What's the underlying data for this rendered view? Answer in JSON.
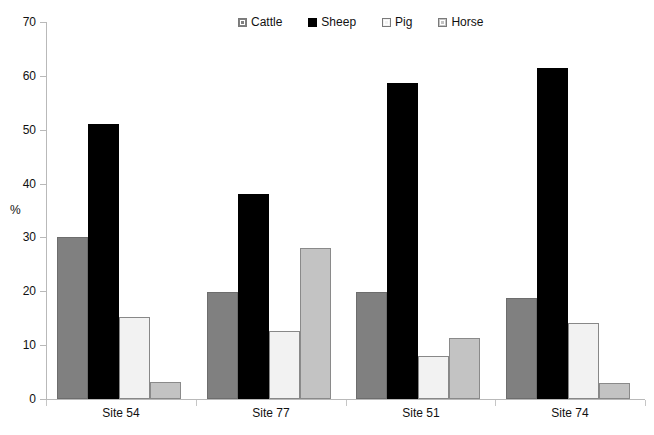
{
  "chart_data": {
    "type": "bar",
    "title": "",
    "xlabel": "",
    "ylabel": "%",
    "ylim": [
      0,
      70
    ],
    "yticks": [
      0,
      10,
      20,
      30,
      40,
      50,
      60,
      70
    ],
    "grid": false,
    "legend_position": "top-center",
    "categories": [
      "Site 54",
      "Site 77",
      "Site 51",
      "Site 74"
    ],
    "series": [
      {
        "name": "Cattle",
        "color": "#808080",
        "values": [
          30.1,
          19.9,
          19.9,
          18.7
        ]
      },
      {
        "name": "Sheep",
        "color": "#000000",
        "values": [
          51.0,
          38.0,
          58.7,
          61.4
        ]
      },
      {
        "name": "Pig",
        "color": "#F2F2F2",
        "values": [
          15.2,
          12.7,
          8.0,
          14.2
        ]
      },
      {
        "name": "Horse",
        "color": "#C3C3C3",
        "values": [
          3.2,
          28.1,
          11.4,
          3.0
        ]
      }
    ]
  },
  "axis": {
    "y_title": "%",
    "tick_labels": [
      "70",
      "60",
      "50",
      "40",
      "30",
      "20",
      "10",
      "0"
    ]
  },
  "legend": {
    "items": [
      {
        "label": "Cattle",
        "icon": "legend-swatch-cattle"
      },
      {
        "label": "Sheep",
        "icon": "legend-swatch-sheep"
      },
      {
        "label": "Pig",
        "icon": "legend-swatch-pig"
      },
      {
        "label": "Horse",
        "icon": "legend-swatch-horse"
      }
    ]
  }
}
